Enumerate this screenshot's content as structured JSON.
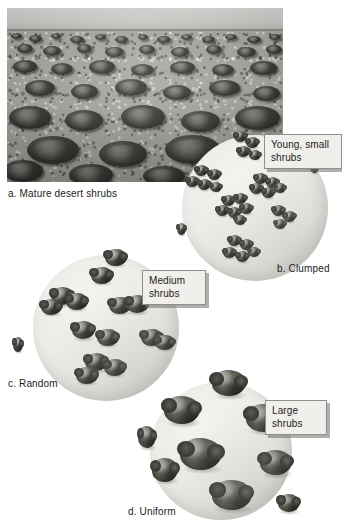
{
  "figure": {
    "background_color": "#ffffff",
    "text_color": "#1b1b19"
  },
  "photo": {
    "name": "mature-desert-shrubs-photograph",
    "alt": "Black and white photograph of a flat desert plain covered with scattered mature shrubs receding to a distant horizon",
    "caption": "a. Mature desert shrubs"
  },
  "panels": [
    {
      "id": "clumped",
      "caption": "b. Clumped",
      "callout_label": "Young, small\nshrubs",
      "shrub_size": "small",
      "pattern": "clumped",
      "shrub_count": 27
    },
    {
      "id": "random",
      "caption": "c. Random",
      "callout_label": "Medium\nshrubs",
      "shrub_size": "medium",
      "pattern": "random",
      "shrub_count": 14
    },
    {
      "id": "uniform",
      "caption": "d. Uniform",
      "callout_label": "Large\nshrubs",
      "shrub_size": "large",
      "pattern": "uniform",
      "shrub_count": 9
    }
  ],
  "colors": {
    "quadrat_fill": "#ebebe7",
    "shrub_dark": "#3a3a34",
    "callout_fill": "#f0efec",
    "callout_border": "#8f8f8a",
    "photo_sky": "#d8d8d6",
    "photo_ground": "#a9a9a3"
  }
}
